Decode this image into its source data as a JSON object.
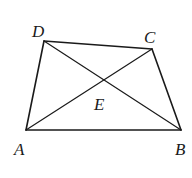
{
  "diagram": {
    "type": "quadrilateral-with-diagonals",
    "stroke_color": "#1a1a1a",
    "background": "#ffffff",
    "vertices": {
      "A": {
        "x": 26,
        "y": 130
      },
      "B": {
        "x": 181,
        "y": 130
      },
      "C": {
        "x": 152,
        "y": 49
      },
      "D": {
        "x": 44,
        "y": 41
      }
    },
    "intersection": {
      "E": {
        "x": 105,
        "y": 80
      }
    },
    "labels": {
      "A": "A",
      "B": "B",
      "C": "C",
      "D": "D",
      "E": "E"
    },
    "segments": [
      "AB",
      "BC",
      "CD",
      "DA",
      "AC",
      "BD"
    ]
  }
}
